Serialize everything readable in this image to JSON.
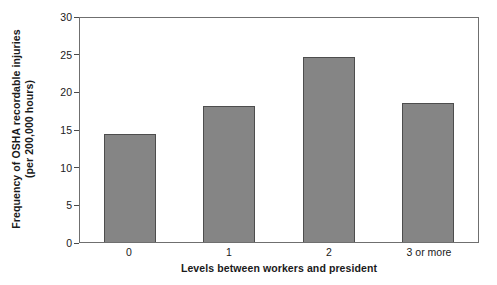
{
  "chart_data": {
    "type": "bar",
    "title": "",
    "categories": [
      "0",
      "1",
      "2",
      "3 or more"
    ],
    "values": [
      14.3,
      18.0,
      24.6,
      18.4
    ],
    "xlabel": "Levels between workers and president",
    "ylabel_line1": "Frequency of OSHA recordable injuries",
    "ylabel_line2": "(per 200,000 hours)",
    "ylim": [
      0,
      30
    ],
    "yticks": [
      0,
      5,
      10,
      15,
      20,
      25,
      30
    ],
    "ytick_labels": [
      "0",
      "5",
      "10",
      "15",
      "20",
      "25",
      "30"
    ],
    "grid": false,
    "legend": null,
    "bar_color": "#858585",
    "bar_edge_color": "#4d4d4d",
    "axis_color": "#6f6f6f",
    "background": "#ffffff"
  }
}
